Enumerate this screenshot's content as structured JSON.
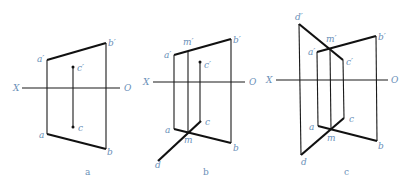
{
  "figures": [
    {
      "caption": "a",
      "labels": {
        "a_prime": "a′",
        "b_prime": "b′",
        "c_prime": "c′",
        "X": "X",
        "O": "O",
        "a": "a",
        "b": "b",
        "c": "c"
      }
    },
    {
      "caption": "b",
      "labels": {
        "a_prime": "a′",
        "m_prime": "m′",
        "b_prime": "b′",
        "c_prime": "c′",
        "X": "X",
        "O": "O",
        "a": "a",
        "m": "m",
        "b": "b",
        "c": "c",
        "d": "d"
      }
    },
    {
      "caption": "c",
      "labels": {
        "d_prime": "d′",
        "m_prime": "m′",
        "a_prime": "a′",
        "b_prime": "b′",
        "c_prime": "c′",
        "X": "X",
        "O": "O",
        "a": "a",
        "m": "m",
        "b": "b",
        "c": "c",
        "d": "d"
      }
    }
  ],
  "colors": {
    "line": "#111111",
    "label": "#6a8fb8"
  }
}
